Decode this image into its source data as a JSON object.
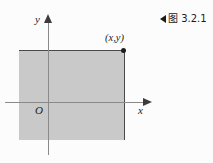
{
  "caption": {
    "marker_icon": "left-triangle-icon",
    "text": "图 3.2.1"
  },
  "chart_data": {
    "type": "area",
    "title": "图 3.2.1",
    "xlabel": "x",
    "ylabel": "y",
    "grid": false,
    "legend": null,
    "axes": {
      "x_axis_label": "x",
      "y_axis_label": "y",
      "origin_label": "O",
      "x_arrow": true,
      "y_arrow": true
    },
    "annotations": [
      {
        "label": "(x,y)",
        "kind": "point",
        "marker": "filled-dot"
      }
    ],
    "region": {
      "description": "shaded rectangle spanning the second, third and fourth quadrant area up to the point (x,y)",
      "fill_color": "#c9c9c9",
      "edge_color": "#4a4a4a"
    }
  },
  "colors": {
    "background": "#fcfcfc",
    "region_fill": "#c9c9c9",
    "region_edge": "#4a4a4a",
    "axis": "#8a8a8a",
    "arrow": "#3c3c3c",
    "text": "#1c1c1c"
  }
}
